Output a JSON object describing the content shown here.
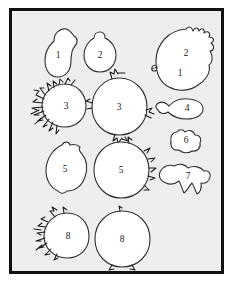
{
  "figure": {
    "title": "",
    "frame": {
      "background_color": "#eeeeee",
      "border_color": "#111111",
      "page_color": "#ffffff"
    },
    "shape_style": {
      "fill_color": "#ffffff",
      "outline_color": "#303030",
      "bristle_color": "#1b1b1b"
    },
    "objects": [
      {
        "id": "obj-1-pear",
        "label": "1",
        "description": "small pear-shaped blob, smooth outline, small lobe at upper right",
        "column": "left",
        "row": 1,
        "center": {
          "x": 51,
          "y": 45
        },
        "size": {
          "w": 36,
          "h": 52
        },
        "ornament": "none"
      },
      {
        "id": "obj-2-stemmed",
        "label": "2",
        "description": "small round blob with short stem or nipple on top",
        "column": "middle",
        "row": 1,
        "center": {
          "x": 95,
          "y": 48
        },
        "size": {
          "w": 33,
          "h": 42
        },
        "ornament": "stem-top"
      },
      {
        "id": "obj-2-1-large",
        "label": "2",
        "secondary_label": "1",
        "description": "large round blob with spiky crown of projections along upper right margin",
        "column": "right",
        "row": 1,
        "center": {
          "x": 180,
          "y": 51
        },
        "size": {
          "w": 58,
          "h": 58
        },
        "ornament": "spikes-upper-right"
      },
      {
        "id": "obj-3-hairy",
        "label": "3",
        "description": "round blob with dense hair-like bristles along the entire left margin",
        "column": "left",
        "row": 2,
        "center": {
          "x": 60,
          "y": 103
        },
        "size": {
          "w": 44,
          "h": 44
        },
        "ornament": "dense-bristles-left"
      },
      {
        "id": "obj-3-tufted",
        "label": "3",
        "description": "large round blob with small scattered tufts at top, left, right and bottom",
        "column": "middle",
        "row": 2,
        "center": {
          "x": 114,
          "y": 104
        },
        "size": {
          "w": 55,
          "h": 56
        },
        "ornament": "scattered-tufts"
      },
      {
        "id": "obj-4-tailed",
        "label": "4",
        "description": "small oval blob with a pointed tail extending to the left",
        "column": "right",
        "row": 2,
        "center": {
          "x": 178,
          "y": 101
        },
        "size": {
          "w": 34,
          "h": 17
        },
        "ornament": "tail-left"
      },
      {
        "id": "obj-6-lobed",
        "label": "6",
        "description": "small irregular lobed blob",
        "column": "right",
        "row": 3,
        "center": {
          "x": 178,
          "y": 133
        },
        "size": {
          "w": 26,
          "h": 20
        },
        "ornament": "none"
      },
      {
        "id": "obj-5-lemon",
        "label": "5",
        "description": "lemon shaped blob with small bumps at top and bottom",
        "column": "left",
        "row": 3,
        "center": {
          "x": 59,
          "y": 168
        },
        "size": {
          "w": 40,
          "h": 48
        },
        "ornament": "bumps-top-bottom"
      },
      {
        "id": "obj-5-spiked",
        "label": "5",
        "description": "large round blob with triangular spikes along the right margin",
        "column": "middle",
        "row": 3,
        "center": {
          "x": 116,
          "y": 167
        },
        "size": {
          "w": 57,
          "h": 57
        },
        "ornament": "spikes-right"
      },
      {
        "id": "obj-7-jagged",
        "label": "7",
        "description": "irregular blob with several pointed projections hanging downward",
        "column": "right",
        "row": 4,
        "center": {
          "x": 180,
          "y": 169
        },
        "size": {
          "w": 40,
          "h": 25
        },
        "ornament": "points-down"
      },
      {
        "id": "obj-8-jagged",
        "label": "8",
        "description": "round blob with jagged ragged protrusions on the left margin",
        "column": "left",
        "row": 4,
        "center": {
          "x": 61,
          "y": 232
        },
        "size": {
          "w": 44,
          "h": 45
        },
        "ornament": "jagged-left"
      },
      {
        "id": "obj-8-plain",
        "label": "8",
        "description": "large smooth round blob with tiny nicks at top and bottom",
        "column": "middle",
        "row": 4,
        "center": {
          "x": 117,
          "y": 235
        },
        "size": {
          "w": 55,
          "h": 55
        },
        "ornament": "nicks-top-bottom"
      }
    ]
  }
}
